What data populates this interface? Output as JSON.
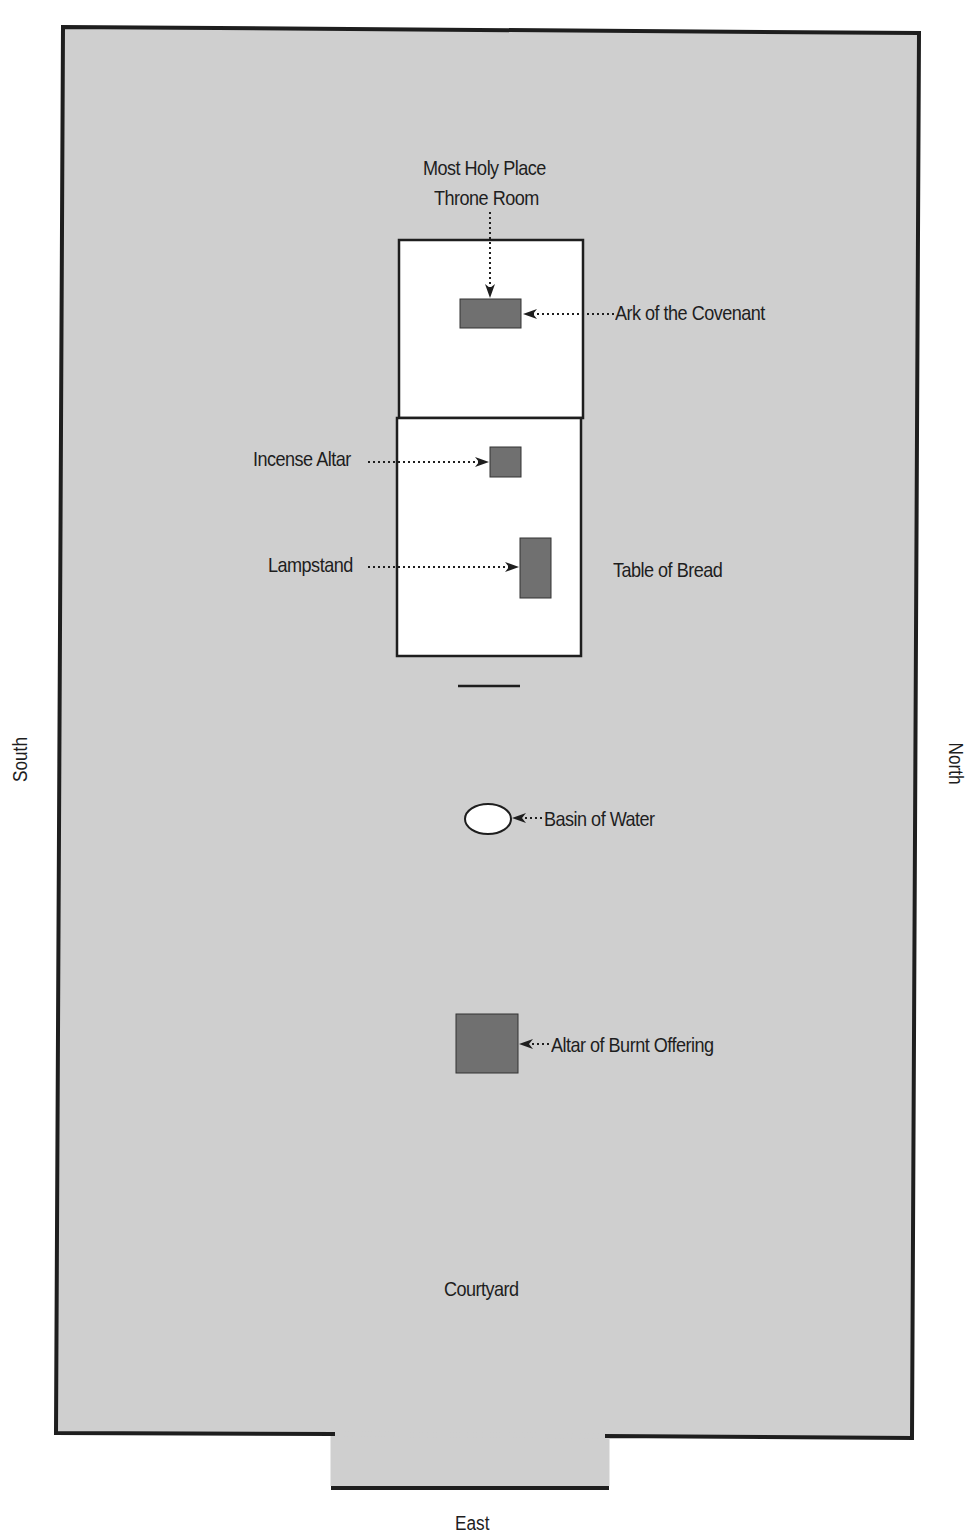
{
  "diagram": {
    "colors": {
      "courtyard_fill": "#cfcfcf",
      "wall_stroke": "#1e1e1e",
      "building_fill": "#ffffff",
      "furniture_fill": "#707070",
      "page_bg": "#ffffff"
    },
    "compass": {
      "left": "South",
      "right": "North",
      "bottom": "East"
    },
    "areas": {
      "courtyard": "Courtyard",
      "most_holy_place_line1": "Most Holy Place",
      "most_holy_place_line2": "Throne Room"
    },
    "items": [
      {
        "id": "ark",
        "label": "Ark of the Covenant"
      },
      {
        "id": "incense-altar",
        "label": "Incense Altar"
      },
      {
        "id": "lampstand",
        "label": "Lampstand"
      },
      {
        "id": "table-of-bread",
        "label": "Table of Bread"
      },
      {
        "id": "basin",
        "label": "Basin of Water"
      },
      {
        "id": "altar-burnt-offering",
        "label": "Altar of Burnt Offering"
      }
    ]
  }
}
